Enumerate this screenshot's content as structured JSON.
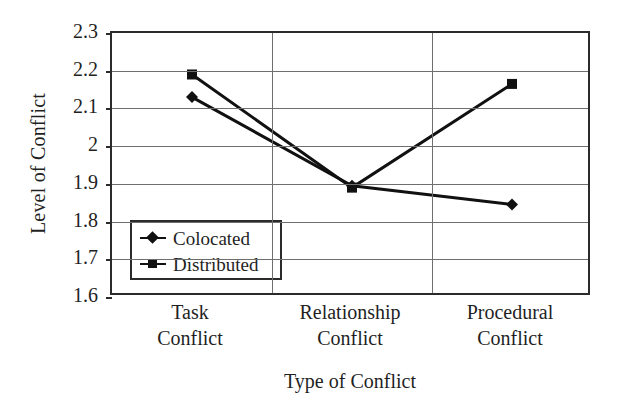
{
  "chart_data": {
    "type": "line",
    "title": "",
    "xlabel": "Type of Conflict",
    "ylabel": "Level of Conflict",
    "categories": [
      "Task\nConflict",
      "Relationship\nConflict",
      "Procedural\nConflict"
    ],
    "category_lines": [
      [
        "Task",
        "Conflict"
      ],
      [
        "Relationship",
        "Conflict"
      ],
      [
        "Procedural",
        "Conflict"
      ]
    ],
    "ylim": [
      1.6,
      2.3
    ],
    "ytick_values": [
      2.3,
      2.2,
      2.1,
      2.0,
      1.9,
      1.8,
      1.7,
      1.6
    ],
    "ytick_labels": [
      "2.3",
      "2.2",
      "2.1",
      "2",
      "1.9",
      "1.8",
      "1.7",
      "1.6"
    ],
    "grid": true,
    "legend_position": "lower-left-inside",
    "series": [
      {
        "name": "Colocated",
        "marker": "diamond",
        "color": "#111111",
        "values": [
          2.13,
          1.895,
          1.845
        ]
      },
      {
        "name": "Distributed",
        "marker": "square",
        "color": "#111111",
        "values": [
          2.19,
          1.89,
          2.165
        ]
      }
    ]
  },
  "legend": {
    "entries": [
      {
        "label": "Colocated",
        "marker": "diamond"
      },
      {
        "label": "Distributed",
        "marker": "square"
      }
    ]
  }
}
